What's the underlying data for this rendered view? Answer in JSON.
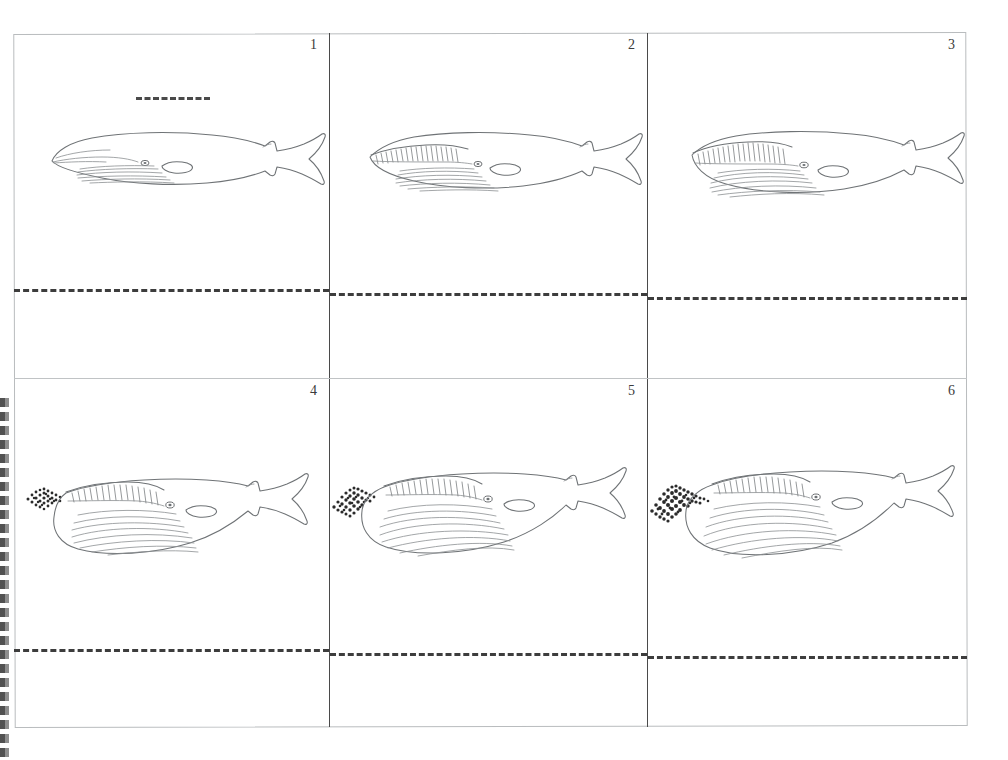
{
  "sheet": {
    "title": "Whale Lunge-Feeding Flipbook Sheet",
    "description": "Scanned worksheet: 3 x 2 grid of line-art panels showing a baleen whale lunge-feeding sequence, each panel with a horizontal dashed fold line.",
    "background_color": "#ffffff",
    "ink_color": "#6f7376",
    "divider_color": "#4a4a4a",
    "frame_color": "#b9bcbe",
    "dash_color": "#3d3d3d",
    "krill_color": "#2b2b2b",
    "columns": 3,
    "rows": 2,
    "panel_count": 6
  },
  "left_margin": {
    "name": "perforated-strip",
    "note": "dark torn / perforated tear-off strip along the lower-left edge of the scan"
  },
  "guide": {
    "top_dashes_label": "fold guide dashes"
  },
  "panels": [
    {
      "number": "1",
      "stage_label": "mouth closed, cruising",
      "mouth_open": 0,
      "throat_expansion": 0,
      "krill_size": 0,
      "baleen_visible": false,
      "has_guide_dashes": true
    },
    {
      "number": "2",
      "stage_label": "jaw begins to open, baleen showing",
      "mouth_open": 1,
      "throat_expansion": 0,
      "krill_size": 0,
      "baleen_visible": true,
      "has_guide_dashes": false
    },
    {
      "number": "3",
      "stage_label": "jaw wider, throat pleats stretching",
      "mouth_open": 2,
      "throat_expansion": 1,
      "krill_size": 0,
      "baleen_visible": true,
      "has_guide_dashes": false
    },
    {
      "number": "4",
      "stage_label": "throat pouch inflates, krill swarm approaching",
      "mouth_open": 3,
      "throat_expansion": 2,
      "krill_size": 1,
      "baleen_visible": true,
      "has_guide_dashes": false
    },
    {
      "number": "5",
      "stage_label": "pouch fully distended, engulfing krill",
      "mouth_open": 3,
      "throat_expansion": 3,
      "krill_size": 2,
      "baleen_visible": true,
      "has_guide_dashes": false
    },
    {
      "number": "6",
      "stage_label": "krill swarm drawn into the mouth",
      "mouth_open": 3,
      "throat_expansion": 3,
      "krill_size": 3,
      "baleen_visible": true,
      "has_guide_dashes": false
    }
  ]
}
